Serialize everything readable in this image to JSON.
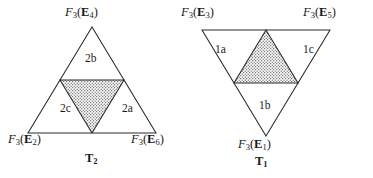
{
  "figure": {
    "background_color": "#ffffff",
    "stroke_color": "#2a2a2a",
    "shade_fill_color": "#d8d8d8",
    "triangles": [
      {
        "name": "T2",
        "caption": "T",
        "caption_sub": "2",
        "orientation": "up",
        "vertices": [
          {
            "label_F": "F",
            "label_F_sub": "3",
            "arg": "E",
            "arg_sub": "4",
            "position": "top"
          },
          {
            "label_F": "F",
            "label_F_sub": "3",
            "arg": "E",
            "arg_sub": "2",
            "position": "bottom-left"
          },
          {
            "label_F": "F",
            "label_F_sub": "3",
            "arg": "E",
            "arg_sub": "6",
            "position": "bottom-right"
          }
        ],
        "regions": [
          {
            "label": "2b",
            "position": "top"
          },
          {
            "label": "2c",
            "position": "bottom-left"
          },
          {
            "label": "2a",
            "position": "bottom-right"
          },
          {
            "label": "",
            "position": "center-shaded"
          }
        ]
      },
      {
        "name": "T1",
        "caption": "T",
        "caption_sub": "1",
        "orientation": "down",
        "vertices": [
          {
            "label_F": "F",
            "label_F_sub": "3",
            "arg": "E",
            "arg_sub": "3",
            "position": "top-left"
          },
          {
            "label_F": "F",
            "label_F_sub": "3",
            "arg": "E",
            "arg_sub": "5",
            "position": "top-right"
          },
          {
            "label_F": "F",
            "label_F_sub": "3",
            "arg": "E",
            "arg_sub": "1",
            "position": "bottom"
          }
        ],
        "regions": [
          {
            "label": "1a",
            "position": "top-left"
          },
          {
            "label": "1c",
            "position": "top-right"
          },
          {
            "label": "1b",
            "position": "bottom"
          },
          {
            "label": "",
            "position": "center-shaded"
          }
        ]
      }
    ]
  },
  "labels": {
    "t2_top": {
      "F": "F",
      "Fsub": "3",
      "arg": "E",
      "argsub": "4"
    },
    "t2_bottom_left": {
      "F": "F",
      "Fsub": "3",
      "arg": "E",
      "argsub": "2"
    },
    "t2_bottom_right": {
      "F": "F",
      "Fsub": "3",
      "arg": "E",
      "argsub": "6"
    },
    "t1_top_left": {
      "F": "F",
      "Fsub": "3",
      "arg": "E",
      "argsub": "3"
    },
    "t1_top_right": {
      "F": "F",
      "Fsub": "3",
      "arg": "E",
      "argsub": "5"
    },
    "t1_bottom": {
      "F": "F",
      "Fsub": "3",
      "arg": "E",
      "argsub": "1"
    },
    "region_2b": "2b",
    "region_2c": "2c",
    "region_2a": "2a",
    "region_1a": "1a",
    "region_1c": "1c",
    "region_1b": "1b",
    "caption_t2": "T",
    "caption_t2_sub": "2",
    "caption_t1": "T",
    "caption_t1_sub": "1"
  }
}
